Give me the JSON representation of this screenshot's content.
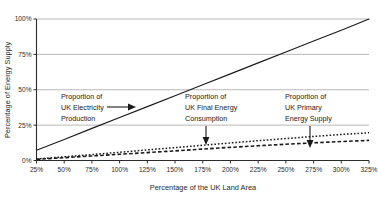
{
  "chart_data": {
    "type": "line",
    "title": "",
    "xlabel": "Percentage of the UK Land Area",
    "ylabel": "Percentage of Energy Supply",
    "xlim": [
      25,
      325
    ],
    "ylim": [
      0,
      100
    ],
    "xticks": [
      "25%",
      "50%",
      "75%",
      "100%",
      "125%",
      "150%",
      "175%",
      "200%",
      "225%",
      "250%",
      "275%",
      "300%",
      "325%"
    ],
    "xtick_values": [
      25,
      50,
      75,
      100,
      125,
      150,
      175,
      200,
      225,
      250,
      275,
      300,
      325
    ],
    "yticks": [
      "0%",
      "25%",
      "50%",
      "75%",
      "100%"
    ],
    "ytick_values": [
      0,
      25,
      50,
      75,
      100
    ],
    "grid": "horizontal",
    "legend_position": "none",
    "x": [
      25,
      50,
      75,
      100,
      125,
      150,
      175,
      200,
      225,
      250,
      275,
      300,
      325
    ],
    "series": [
      {
        "name": "Proportion of UK Electricity Production",
        "style": "solid",
        "color": "#1a1a1a",
        "values": [
          7.2,
          14.9,
          22.7,
          30.4,
          38.1,
          45.8,
          53.5,
          61.2,
          69.0,
          76.7,
          84.4,
          92.1,
          100.0
        ]
      },
      {
        "name": "Proportion of UK Final Energy Consumption",
        "style": "dotted",
        "color": "#1a1a1a",
        "values": [
          1.1,
          2.6,
          4.2,
          5.8,
          7.5,
          9.1,
          10.8,
          12.4,
          14.0,
          15.5,
          17.0,
          18.4,
          19.6
        ]
      },
      {
        "name": "Proportion of UK Primary Energy Supply",
        "style": "dashed",
        "color": "#1a1a1a",
        "values": [
          0.8,
          2.0,
          3.2,
          4.4,
          5.6,
          6.8,
          8.1,
          9.3,
          10.4,
          11.5,
          12.5,
          13.4,
          14.2
        ]
      }
    ],
    "annotations": [
      {
        "id": "electricity",
        "lines": [
          "Proportion of",
          "UK Electricity",
          "Production"
        ],
        "arrow": "right"
      },
      {
        "id": "final-energy",
        "lines": [
          "Proportion of",
          "UK Final Energy",
          "Consumption"
        ],
        "arrow": "down"
      },
      {
        "id": "primary-energy",
        "lines": [
          "Proportion of",
          "UK Primary",
          "Energy Supply"
        ],
        "arrow": "down"
      }
    ],
    "colors": {
      "gridline": "#b0b0b0",
      "axis": "#2b2b2b",
      "series": "#1a1a1a",
      "background": "#ffffff"
    }
  }
}
